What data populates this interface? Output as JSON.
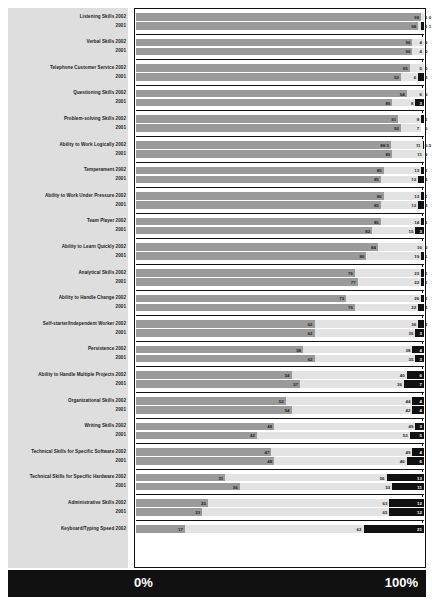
{
  "footer": {
    "left_label": "0%",
    "right_label": "100%"
  },
  "colors": {
    "primary": "#9a9a9a",
    "middle": "#e3e3e3",
    "dark": "#111111",
    "panel": "#dedede"
  },
  "chart_data": {
    "type": "bar",
    "subtype": "horizontal-100-percent-stacked",
    "title": "",
    "xlabel": "",
    "ylabel": "",
    "xlim": [
      0,
      100
    ],
    "grid": false,
    "legend": "none",
    "axis_tick_labels": [
      "0%",
      "100%"
    ],
    "segment_names": [
      "primary",
      "middle",
      "dark"
    ],
    "categories": [
      "Listening Skills 2002",
      "2001",
      "Verbal Skills 2002",
      "2001",
      "Telephone Customer Service 2002",
      "2001",
      "Questioning Skills 2002",
      "2001",
      "Problem-solving Skills 2002",
      "2001",
      "Ability to Work Logically 2002",
      "2001",
      "Temperament 2002",
      "2001",
      "Ability to Work Under Pressure 2002",
      "2001",
      "Team Player 2002",
      "2001",
      "Ability to Learn Quickly 2002",
      "2001",
      "Analytical Skills 2002",
      "2001",
      "Ability to Handle Change 2002",
      "2001",
      "Self-starter/Independent Worker 2002",
      "2001",
      "Persistence 2002",
      "2001",
      "Ability to Handle Multiple Projects 2002",
      "2001",
      "Organizational Skills 2002",
      "2001",
      "Writing Skills 2002",
      "2001",
      "Technical Skills for Specific Software 2002",
      "2001",
      "Technical Skills for Specific Hardware 2002",
      "2001",
      "Administrative Skills 2002",
      "2001",
      "Keyboard/Typing Speed 2002"
    ],
    "rows": [
      {
        "group": "Listening Skills",
        "year": "2002",
        "primary": 99,
        "middle": 1,
        "dark": 0
      },
      {
        "group": "Listening Skills",
        "year": "2001",
        "primary": 98,
        "middle": 1,
        "dark": 1
      },
      {
        "group": "Verbal Skills",
        "year": "2002",
        "primary": 96,
        "middle": 4,
        "dark": 0
      },
      {
        "group": "Verbal Skills",
        "year": "2001",
        "primary": 96,
        "middle": 4,
        "dark": 0
      },
      {
        "group": "Telephone Customer Service",
        "year": "2002",
        "primary": 95,
        "middle": 5,
        "dark": 0
      },
      {
        "group": "Telephone Customer Service",
        "year": "2001",
        "primary": 92,
        "middle": 6,
        "dark": 2
      },
      {
        "group": "Questioning Skills",
        "year": "2002",
        "primary": 94,
        "middle": 6,
        "dark": 0
      },
      {
        "group": "Questioning Skills",
        "year": "2001",
        "primary": 89,
        "middle": 8,
        "dark": 3
      },
      {
        "group": "Problem-solving Skills",
        "year": "2002",
        "primary": 91,
        "middle": 8,
        "dark": 1
      },
      {
        "group": "Problem-solving Skills",
        "year": "2001",
        "primary": 92,
        "middle": 7,
        "dark": 0
      },
      {
        "group": "Ability to Work Logically",
        "year": "2002",
        "primary": 88.5,
        "middle": 11,
        "dark": 0.5
      },
      {
        "group": "Ability to Work Logically",
        "year": "2001",
        "primary": 89,
        "middle": 11,
        "dark": 0
      },
      {
        "group": "Temperament",
        "year": "2002",
        "primary": 86,
        "middle": 13,
        "dark": 1
      },
      {
        "group": "Temperament",
        "year": "2001",
        "primary": 85,
        "middle": 13,
        "dark": 2
      },
      {
        "group": "Ability to Work Under Pressure",
        "year": "2002",
        "primary": 86,
        "middle": 13,
        "dark": 1
      },
      {
        "group": "Ability to Work Under Pressure",
        "year": "2001",
        "primary": 85,
        "middle": 13,
        "dark": 2
      },
      {
        "group": "Team Player",
        "year": "2002",
        "primary": 85,
        "middle": 14,
        "dark": 1
      },
      {
        "group": "Team Player",
        "year": "2001",
        "primary": 82,
        "middle": 15,
        "dark": 3
      },
      {
        "group": "Ability to Learn Quickly",
        "year": "2002",
        "primary": 84,
        "middle": 16,
        "dark": 0
      },
      {
        "group": "Ability to Learn Quickly",
        "year": "2001",
        "primary": 80,
        "middle": 19,
        "dark": 1
      },
      {
        "group": "Analytical Skills",
        "year": "2002",
        "primary": 76,
        "middle": 23,
        "dark": 1
      },
      {
        "group": "Analytical Skills",
        "year": "2001",
        "primary": 77,
        "middle": 22,
        "dark": 1
      },
      {
        "group": "Ability to Handle Change",
        "year": "2002",
        "primary": 73,
        "middle": 26,
        "dark": 1
      },
      {
        "group": "Ability to Handle Change",
        "year": "2001",
        "primary": 76,
        "middle": 22,
        "dark": 2
      },
      {
        "group": "Self-starter/Independent Worker",
        "year": "2002",
        "primary": 62,
        "middle": 36,
        "dark": 2
      },
      {
        "group": "Self-starter/Independent Worker",
        "year": "2001",
        "primary": 62,
        "middle": 35,
        "dark": 3
      },
      {
        "group": "Persistence",
        "year": "2002",
        "primary": 58,
        "middle": 38,
        "dark": 4
      },
      {
        "group": "Persistence",
        "year": "2001",
        "primary": 62,
        "middle": 35,
        "dark": 3
      },
      {
        "group": "Ability to Handle Multiple Projects",
        "year": "2002",
        "primary": 54,
        "middle": 40,
        "dark": 6
      },
      {
        "group": "Ability to Handle Multiple Projects",
        "year": "2001",
        "primary": 57,
        "middle": 36,
        "dark": 7
      },
      {
        "group": "Organizational Skills",
        "year": "2002",
        "primary": 52,
        "middle": 44,
        "dark": 4
      },
      {
        "group": "Organizational Skills",
        "year": "2001",
        "primary": 54,
        "middle": 42,
        "dark": 4
      },
      {
        "group": "Writing Skills",
        "year": "2002",
        "primary": 48,
        "middle": 49,
        "dark": 3
      },
      {
        "group": "Writing Skills",
        "year": "2001",
        "primary": 42,
        "middle": 53,
        "dark": 5
      },
      {
        "group": "Technical Skills for Specific Software",
        "year": "2002",
        "primary": 47,
        "middle": 49,
        "dark": 4
      },
      {
        "group": "Technical Skills for Specific Software",
        "year": "2001",
        "primary": 48,
        "middle": 46,
        "dark": 6
      },
      {
        "group": "Technical Skills for Specific Hardware",
        "year": "2002",
        "primary": 31,
        "middle": 56,
        "dark": 13
      },
      {
        "group": "Technical Skills for Specific Hardware",
        "year": "2001",
        "primary": 36,
        "middle": 53,
        "dark": 11
      },
      {
        "group": "Administrative Skills",
        "year": "2002",
        "primary": 25,
        "middle": 63,
        "dark": 12
      },
      {
        "group": "Administrative Skills",
        "year": "2001",
        "primary": 23,
        "middle": 65,
        "dark": 12
      },
      {
        "group": "Keyboard/Typing Speed",
        "year": "2002",
        "primary": 17,
        "middle": 62,
        "dark": 21
      }
    ]
  }
}
